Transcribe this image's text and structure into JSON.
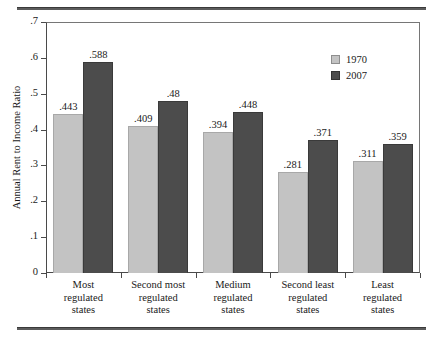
{
  "chart_data": {
    "type": "bar",
    "title": "",
    "subtitle": "",
    "xlabel": "",
    "ylabel": "Annual Rent to Income Ratio",
    "ylim": [
      0,
      0.7
    ],
    "yticks": [
      "0",
      ".1",
      ".2",
      ".3",
      ".4",
      ".5",
      ".6",
      ".7"
    ],
    "ytick_values": [
      0,
      0.1,
      0.2,
      0.3,
      0.4,
      0.5,
      0.6,
      0.7
    ],
    "grid": false,
    "legend_position": "top-right",
    "categories": [
      "Most\nregulated\nstates",
      "Second most\nregulated\nstates",
      "Medium\nregulated\nstates",
      "Second least\nregulated\nstates",
      "Least\nregulated\nstates"
    ],
    "series": [
      {
        "name": "1970",
        "color": "#c3c3c3",
        "values": [
          0.443,
          0.409,
          0.394,
          0.281,
          0.311
        ],
        "labels": [
          ".443",
          ".409",
          ".394",
          ".281",
          ".311"
        ]
      },
      {
        "name": "2007",
        "color": "#4c4c4c",
        "values": [
          0.588,
          0.48,
          0.448,
          0.371,
          0.359
        ],
        "labels": [
          ".588",
          ".48",
          ".448",
          ".371",
          ".359"
        ]
      }
    ]
  },
  "legend": {
    "entries": [
      {
        "label": "1970",
        "swatch": "legend-swatch-1970"
      },
      {
        "label": "2007",
        "swatch": "legend-swatch-2007"
      }
    ]
  },
  "axes": {
    "y_title": "Annual Rent to Income Ratio"
  }
}
